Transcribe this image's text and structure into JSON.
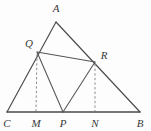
{
  "figure": {
    "background_color": "#fdfdfd",
    "line_color": "#4a4a4a",
    "dashed_color": "#8d8d8d",
    "label_color": "#3a3a3a",
    "points": {
      "A": {
        "label": "A",
        "x": 56,
        "y": 22,
        "label_x": 56,
        "label_y": 12
      },
      "B": {
        "label": "B",
        "x": 140,
        "y": 112,
        "label_x": 140,
        "label_y": 126
      },
      "C": {
        "label": "C",
        "x": 7,
        "y": 112,
        "label_x": 7,
        "label_y": 126
      },
      "Q": {
        "label": "Q",
        "x": 37,
        "y": 52,
        "label_x": 29,
        "label_y": 47
      },
      "R": {
        "label": "R",
        "x": 95,
        "y": 62,
        "label_x": 104,
        "label_y": 59
      },
      "M": {
        "label": "M",
        "x": 36,
        "y": 112,
        "label_x": 36,
        "label_y": 126
      },
      "N": {
        "label": "N",
        "x": 95,
        "y": 112,
        "label_x": 95,
        "label_y": 126
      },
      "P": {
        "label": "P",
        "x": 63,
        "y": 112,
        "label_x": 63,
        "label_y": 126
      }
    },
    "solid_segments": [
      {
        "name": "side-AC",
        "from": "A",
        "to": "C"
      },
      {
        "name": "side-AB",
        "from": "A",
        "to": "B"
      }
    ],
    "baseline_segments": [
      {
        "name": "side-CB",
        "from": "C",
        "to": "B"
      }
    ],
    "inner_segments": [
      {
        "name": "segment-QR",
        "from": "Q",
        "to": "R"
      },
      {
        "name": "segment-QP",
        "from": "Q",
        "to": "P"
      },
      {
        "name": "segment-PR",
        "from": "P",
        "to": "R"
      }
    ],
    "dashed_segments": [
      {
        "name": "altitude-QM",
        "from": "Q",
        "to": "M"
      },
      {
        "name": "altitude-RN",
        "from": "R",
        "to": "N"
      }
    ]
  }
}
